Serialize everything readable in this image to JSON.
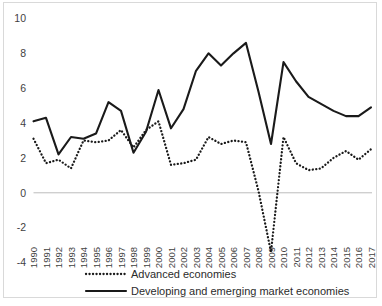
{
  "chart_data": {
    "type": "line",
    "title": "",
    "subtitle": "",
    "xlabel": "",
    "ylabel": "",
    "ylim": [
      -4,
      10
    ],
    "yticks": [
      10,
      8,
      6,
      4,
      2,
      0,
      -2,
      -4
    ],
    "grid": false,
    "legend_position": "bottom",
    "categories": [
      "1990",
      "1991",
      "1992",
      "1993",
      "1994",
      "1995",
      "1996",
      "1997",
      "1998",
      "1999",
      "2000",
      "2001",
      "2002",
      "2003",
      "2004",
      "2005",
      "2006",
      "2007",
      "2008",
      "2009",
      "2010",
      "2011",
      "2012",
      "2013",
      "2014",
      "2015",
      "2016",
      "2017"
    ],
    "series": [
      {
        "name": "Advanced economies",
        "style": "dotted",
        "color": "#1a1a1a",
        "values": [
          3.1,
          1.7,
          1.9,
          1.4,
          3.0,
          2.9,
          3.0,
          3.6,
          2.6,
          3.6,
          4.1,
          1.6,
          1.7,
          1.9,
          3.2,
          2.8,
          3.0,
          2.9,
          0.1,
          -3.4,
          3.2,
          1.7,
          1.3,
          1.4,
          2.0,
          2.4,
          1.9,
          2.5
        ]
      },
      {
        "name": "Developing and emerging market economies",
        "style": "solid",
        "color": "#1a1a1a",
        "values": [
          4.1,
          4.3,
          2.2,
          3.2,
          3.1,
          3.4,
          5.2,
          4.7,
          2.3,
          3.5,
          5.9,
          3.7,
          4.8,
          7.0,
          8.0,
          7.3,
          8.0,
          8.6,
          5.8,
          2.8,
          7.5,
          6.4,
          5.5,
          5.1,
          4.7,
          4.4,
          4.4,
          4.9
        ]
      }
    ]
  },
  "legend": {
    "items": [
      {
        "label": "Advanced economies",
        "style": "dotted"
      },
      {
        "label": "Developing and emerging market economies",
        "style": "solid"
      }
    ]
  }
}
